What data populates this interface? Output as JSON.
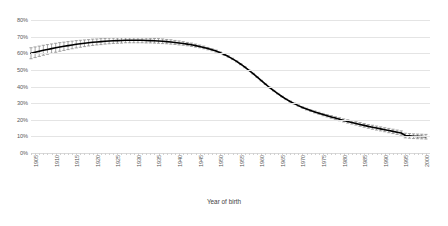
{
  "chart_data": {
    "type": "line",
    "title": "",
    "xlabel": "Year of birth",
    "ylabel": "",
    "ylim": [
      0,
      80
    ],
    "yticks": [
      0,
      10,
      20,
      30,
      40,
      50,
      60,
      70,
      80
    ],
    "ytick_labels": [
      "0%",
      "10%",
      "20%",
      "30%",
      "40%",
      "50%",
      "60%",
      "70%",
      "80%"
    ],
    "xlim": [
      1905,
      2002
    ],
    "xticks": [
      1905,
      1910,
      1915,
      1920,
      1925,
      1930,
      1935,
      1940,
      1945,
      1950,
      1955,
      1960,
      1965,
      1970,
      1975,
      1980,
      1985,
      1990,
      1995,
      2000
    ],
    "xtick_labels": [
      "1905",
      "1910",
      "1915",
      "1920",
      "1925",
      "1930",
      "1935",
      "1940",
      "1945",
      "1950",
      "1955",
      "1960",
      "1965",
      "1970",
      "1975",
      "1980",
      "1985",
      "1990",
      "1995",
      "2000"
    ],
    "grid": true,
    "legend": "none",
    "series_color": "#000000",
    "errorbar_color": "#7f7f7f",
    "has_error_bars": true,
    "series": [
      {
        "name": "Proportion",
        "x": [
          1905,
          1906,
          1907,
          1908,
          1909,
          1910,
          1911,
          1912,
          1913,
          1914,
          1915,
          1916,
          1917,
          1918,
          1919,
          1920,
          1921,
          1922,
          1923,
          1924,
          1925,
          1926,
          1927,
          1928,
          1929,
          1930,
          1931,
          1932,
          1933,
          1934,
          1935,
          1936,
          1937,
          1938,
          1939,
          1940,
          1941,
          1942,
          1943,
          1944,
          1945,
          1946,
          1947,
          1948,
          1949,
          1950,
          1951,
          1952,
          1953,
          1954,
          1955,
          1956,
          1957,
          1958,
          1959,
          1960,
          1961,
          1962,
          1963,
          1964,
          1965,
          1966,
          1967,
          1968,
          1969,
          1970,
          1971,
          1972,
          1973,
          1974,
          1975,
          1976,
          1977,
          1978,
          1979,
          1980,
          1981,
          1982,
          1983,
          1984,
          1985,
          1986,
          1987,
          1988,
          1989,
          1990,
          1991,
          1992,
          1993,
          1994,
          1995,
          1996,
          1997,
          1998,
          1999,
          2000,
          2001
        ],
        "values": [
          60.0,
          60.6,
          61.2,
          61.8,
          62.3,
          62.8,
          63.3,
          63.8,
          64.2,
          64.6,
          65.0,
          65.4,
          65.7,
          66.0,
          66.3,
          66.6,
          66.8,
          67.0,
          67.2,
          67.4,
          67.5,
          67.6,
          67.7,
          67.8,
          67.8,
          67.8,
          67.8,
          67.8,
          67.7,
          67.6,
          67.5,
          67.4,
          67.2,
          67.0,
          66.8,
          66.5,
          66.2,
          65.9,
          65.5,
          65.1,
          64.6,
          64.1,
          63.5,
          62.8,
          62.1,
          61.3,
          60.3,
          59.2,
          58.0,
          56.6,
          55.1,
          53.4,
          51.6,
          49.7,
          47.7,
          45.6,
          43.5,
          41.4,
          39.4,
          37.5,
          35.7,
          34.0,
          32.4,
          31.0,
          29.7,
          28.5,
          27.4,
          26.4,
          25.5,
          24.7,
          23.9,
          23.1,
          22.4,
          21.7,
          21.0,
          20.3,
          19.6,
          19.0,
          18.4,
          17.8,
          17.2,
          16.6,
          16.0,
          15.5,
          15.0,
          14.5,
          14.0,
          13.5,
          13.0,
          12.5,
          12.0,
          10.5,
          10.3,
          10.1,
          10.0,
          9.9,
          9.8
        ],
        "errors": [
          3.3,
          3.2,
          3.1,
          3.0,
          2.9,
          2.8,
          2.7,
          2.6,
          2.5,
          2.4,
          2.3,
          2.2,
          2.1,
          2.0,
          1.9,
          1.9,
          1.8,
          1.8,
          1.7,
          1.7,
          1.6,
          1.6,
          1.6,
          1.5,
          1.5,
          1.5,
          1.5,
          1.5,
          1.5,
          1.4,
          1.4,
          1.4,
          1.4,
          1.3,
          1.3,
          1.2,
          1.2,
          1.1,
          1.0,
          1.0,
          0.9,
          0.8,
          0.8,
          0.7,
          0.6,
          0.6,
          0.5,
          0.5,
          0.4,
          0.4,
          0.3,
          0.3,
          0.3,
          0.2,
          0.2,
          0.2,
          0.2,
          0.2,
          0.2,
          0.2,
          0.2,
          0.2,
          0.3,
          0.3,
          0.3,
          0.4,
          0.4,
          0.5,
          0.5,
          0.6,
          0.6,
          0.7,
          0.7,
          0.8,
          0.8,
          0.9,
          0.9,
          1.0,
          1.0,
          1.0,
          1.1,
          1.1,
          1.1,
          1.2,
          1.2,
          1.2,
          1.2,
          1.3,
          1.3,
          1.3,
          1.3,
          1.4,
          1.4,
          1.4,
          1.4,
          1.4,
          1.4
        ]
      }
    ]
  },
  "caption": {
    "text": ""
  },
  "axis": {
    "x_title": "Year of birth"
  }
}
